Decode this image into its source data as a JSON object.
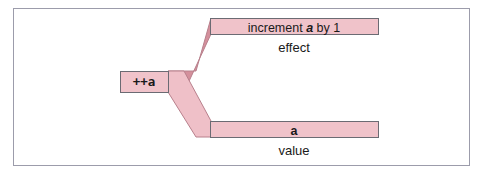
{
  "figure": {
    "title_text": "",
    "colors": {
      "bar_fill": "#f0c3ca",
      "bar_stroke": "#6b6b73",
      "fork_upper_fill": "#d4909c",
      "fork_lower_fill": "#efc0c8",
      "fork_stroke": "#b8808c",
      "frame_stroke": "#9c9cab",
      "background": "#ffffff",
      "text": "#1a1a1a"
    }
  },
  "expression": {
    "label": "++a"
  },
  "branches": [
    {
      "id": "effect",
      "bar_text_prefix": "increment ",
      "bar_text_emphasis": "a",
      "bar_text_suffix": " by 1",
      "caption": "effect"
    },
    {
      "id": "value",
      "bar_text_prefix": "",
      "bar_text_emphasis": "a",
      "bar_text_suffix": "",
      "caption": "value"
    }
  ]
}
